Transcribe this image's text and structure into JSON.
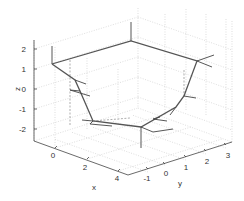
{
  "chart_data": {
    "type": "line",
    "projection": "3d",
    "title": "",
    "xlabel": "x",
    "ylabel": "y",
    "zlabel": "z",
    "xlim": [
      -1,
      5
    ],
    "ylim": [
      -1.5,
      3.5
    ],
    "zlim": [
      -2.5,
      2.5
    ],
    "xticks": [
      "0",
      "2",
      "4"
    ],
    "yticks": [
      "-1",
      "0",
      "1",
      "2",
      "3"
    ],
    "zticks": [
      "2",
      "1",
      "0",
      "-1",
      "-2"
    ],
    "grid": true,
    "legend": null,
    "series": [
      {
        "name": "path",
        "style": "solid",
        "color": "#555555",
        "points_px": [
          [
            52,
            64
          ],
          [
            131,
            41
          ],
          [
            197,
            61
          ],
          [
            184,
            96
          ],
          [
            176,
            107
          ],
          [
            141,
            127
          ],
          [
            93,
            121
          ],
          [
            80,
            91
          ],
          [
            75,
            80
          ],
          [
            52,
            64
          ]
        ]
      }
    ],
    "frame_segments_px": [
      [
        [
          75,
          80
        ],
        [
          86,
          84
        ]
      ],
      [
        [
          131,
          41
        ],
        [
          131,
          22
        ]
      ],
      [
        [
          197,
          61
        ],
        [
          214,
          55
        ]
      ],
      [
        [
          197,
          61
        ],
        [
          212,
          67
        ]
      ],
      [
        [
          184,
          96
        ],
        [
          196,
          98
        ]
      ],
      [
        [
          176,
          107
        ],
        [
          170,
          115
        ]
      ],
      [
        [
          141,
          127
        ],
        [
          141,
          148
        ]
      ],
      [
        [
          141,
          127
        ],
        [
          153,
          132
        ],
        [
          173,
          129
        ]
      ],
      [
        [
          93,
          121
        ],
        [
          82,
          120
        ]
      ],
      [
        [
          52,
          64
        ],
        [
          52,
          46
        ]
      ],
      [
        [
          93,
          121
        ],
        [
          90,
          124
        ],
        [
          112,
          126
        ]
      ],
      [
        [
          80,
          91
        ],
        [
          70,
          90
        ],
        [
          90,
          96
        ]
      ],
      [
        [
          160,
          117
        ],
        [
          153,
          119
        ],
        [
          167,
          121
        ]
      ]
    ]
  },
  "axes": {
    "z_label": "z",
    "x_label": "x",
    "y_label": "y",
    "z_ticks": [
      "2",
      "1",
      "0",
      "-1",
      "-2"
    ],
    "x_ticks": [
      "0",
      "2",
      "4"
    ],
    "y_ticks": [
      "-1",
      "0",
      "1",
      "2",
      "3"
    ]
  }
}
